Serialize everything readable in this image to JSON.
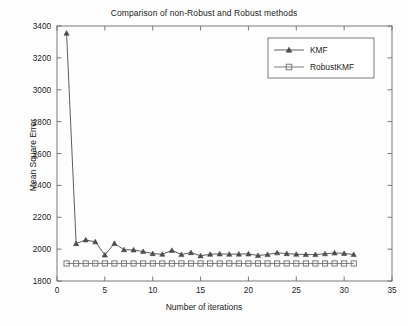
{
  "figure": {
    "background_color": "#fdfdfd",
    "axes_color": "#6b6b6b"
  },
  "chart_data": {
    "type": "line",
    "title": "Comparison of non-Robust and Robust methods",
    "xlabel": "Number of iterations",
    "ylabel": "Mean Square Error",
    "xlim": [
      0,
      35
    ],
    "ylim": [
      1800,
      3400
    ],
    "xticks": [
      0,
      5,
      10,
      15,
      20,
      25,
      30,
      35
    ],
    "yticks": [
      1800,
      2000,
      2200,
      2400,
      2600,
      2800,
      3000,
      3200,
      3400
    ],
    "xticklabels": [
      "0",
      "5",
      "10",
      "15",
      "20",
      "25",
      "30",
      "35"
    ],
    "yticklabels": [
      "1800",
      "2000",
      "2200",
      "2400",
      "2600",
      "2800",
      "3000",
      "3200",
      "3400"
    ],
    "grid": false,
    "legend_position": "upper right",
    "x": [
      1,
      2,
      3,
      4,
      5,
      6,
      7,
      8,
      9,
      10,
      11,
      12,
      13,
      14,
      15,
      16,
      17,
      18,
      19,
      20,
      21,
      22,
      23,
      24,
      25,
      26,
      27,
      28,
      29,
      30,
      31
    ],
    "series": [
      {
        "name": "KMF",
        "marker": "triangle",
        "color": "#4c4c4c",
        "values": [
          3355,
          2035,
          2058,
          2046,
          1963,
          2036,
          1996,
          1995,
          1985,
          1972,
          1968,
          1992,
          1966,
          1978,
          1958,
          1968,
          1970,
          1968,
          1969,
          1970,
          1960,
          1966,
          1977,
          1972,
          1968,
          1966,
          1966,
          1971,
          1976,
          1973,
          1966
        ]
      },
      {
        "name": "RobustKMF",
        "marker": "square",
        "color": "#6e6e6e",
        "values": [
          1910,
          1910,
          1910,
          1910,
          1910,
          1910,
          1910,
          1910,
          1910,
          1910,
          1910,
          1910,
          1910,
          1910,
          1910,
          1910,
          1910,
          1910,
          1910,
          1910,
          1910,
          1910,
          1910,
          1910,
          1910,
          1910,
          1910,
          1910,
          1910,
          1910,
          1910
        ]
      }
    ],
    "legend": [
      {
        "label": "KMF",
        "marker": "triangle"
      },
      {
        "label": "RobustKMF",
        "marker": "square"
      }
    ]
  }
}
